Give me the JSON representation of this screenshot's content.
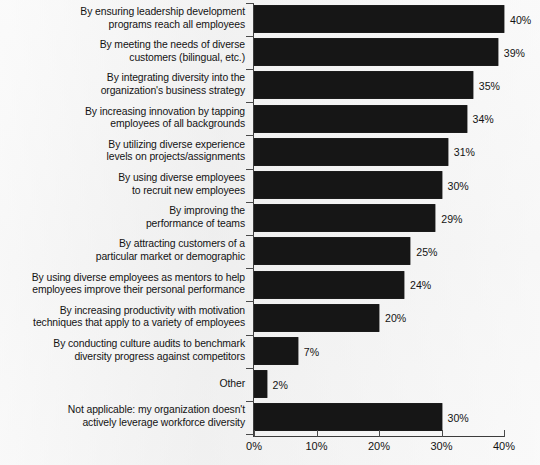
{
  "chart_data": {
    "type": "bar",
    "orientation": "horizontal",
    "title": "",
    "xlabel": "",
    "ylabel": "",
    "xlim": [
      0,
      40
    ],
    "xticks": [
      0,
      10,
      20,
      30,
      40
    ],
    "xtick_labels": [
      "0%",
      "10%",
      "20%",
      "30%",
      "40%"
    ],
    "grid": false,
    "legend": null,
    "value_suffix": "%",
    "bar_color": "#161616",
    "background_color": "#f3f3f3",
    "categories": [
      "By ensuring leadership development programs reach all employees",
      "By meeting the needs of diverse customers (bilingual, etc.)",
      "By integrating diversity into the organization's business strategy",
      "By increasing innovation by tapping employees of all backgrounds",
      "By utilizing diverse experience levels on projects/assignments",
      "By using diverse employees to recruit new employees",
      "By improving the performance of teams",
      "By attracting customers of a particular market or demographic",
      "By using diverse employees as mentors to help employees improve their personal performance",
      "By increasing productivity with motivation techniques that apply to a variety of employees",
      "By conducting culture audits to benchmark diversity progress against competitors",
      "Other",
      "Not applicable: my organization doesn't actively leverage workforce diversity"
    ],
    "values": [
      40,
      39,
      35,
      34,
      31,
      30,
      29,
      25,
      24,
      20,
      7,
      2,
      30
    ],
    "value_labels": [
      "40%",
      "39%",
      "35%",
      "34%",
      "31%",
      "30%",
      "29%",
      "25%",
      "24%",
      "20%",
      "7%",
      "2%",
      "30%"
    ]
  },
  "bars": [
    {
      "lines": [
        "By ensuring leadership development",
        "programs reach all employees"
      ],
      "value": 40,
      "value_label": "40%"
    },
    {
      "lines": [
        "By meeting the needs of diverse",
        "customers (bilingual, etc.)"
      ],
      "value": 39,
      "value_label": "39%"
    },
    {
      "lines": [
        "By integrating diversity into the",
        "organization's business strategy"
      ],
      "value": 35,
      "value_label": "35%"
    },
    {
      "lines": [
        "By increasing innovation by tapping",
        "employees of all backgrounds"
      ],
      "value": 34,
      "value_label": "34%"
    },
    {
      "lines": [
        "By utilizing diverse experience",
        "levels on projects/assignments"
      ],
      "value": 31,
      "value_label": "31%"
    },
    {
      "lines": [
        "By using diverse employees",
        "to recruit new employees"
      ],
      "value": 30,
      "value_label": "30%"
    },
    {
      "lines": [
        "By improving the",
        "performance of teams"
      ],
      "value": 29,
      "value_label": "29%"
    },
    {
      "lines": [
        "By attracting customers of a",
        "particular market or demographic"
      ],
      "value": 25,
      "value_label": "25%"
    },
    {
      "lines": [
        "By using diverse employees as mentors to help",
        "employees improve their personal performance"
      ],
      "value": 24,
      "value_label": "24%"
    },
    {
      "lines": [
        "By increasing productivity with motivation",
        "techniques that apply to a variety of employees"
      ],
      "value": 20,
      "value_label": "20%"
    },
    {
      "lines": [
        "By conducting culture audits to benchmark",
        "diversity progress against competitors"
      ],
      "value": 7,
      "value_label": "7%"
    },
    {
      "lines": [
        "Other"
      ],
      "value": 2,
      "value_label": "2%"
    },
    {
      "lines": [
        "Not applicable: my organization doesn't",
        "actively leverage workforce diversity"
      ],
      "value": 30,
      "value_label": "30%"
    }
  ],
  "axis": {
    "x_tick_labels": [
      "0%",
      "10%",
      "20%",
      "30%",
      "40%"
    ]
  }
}
